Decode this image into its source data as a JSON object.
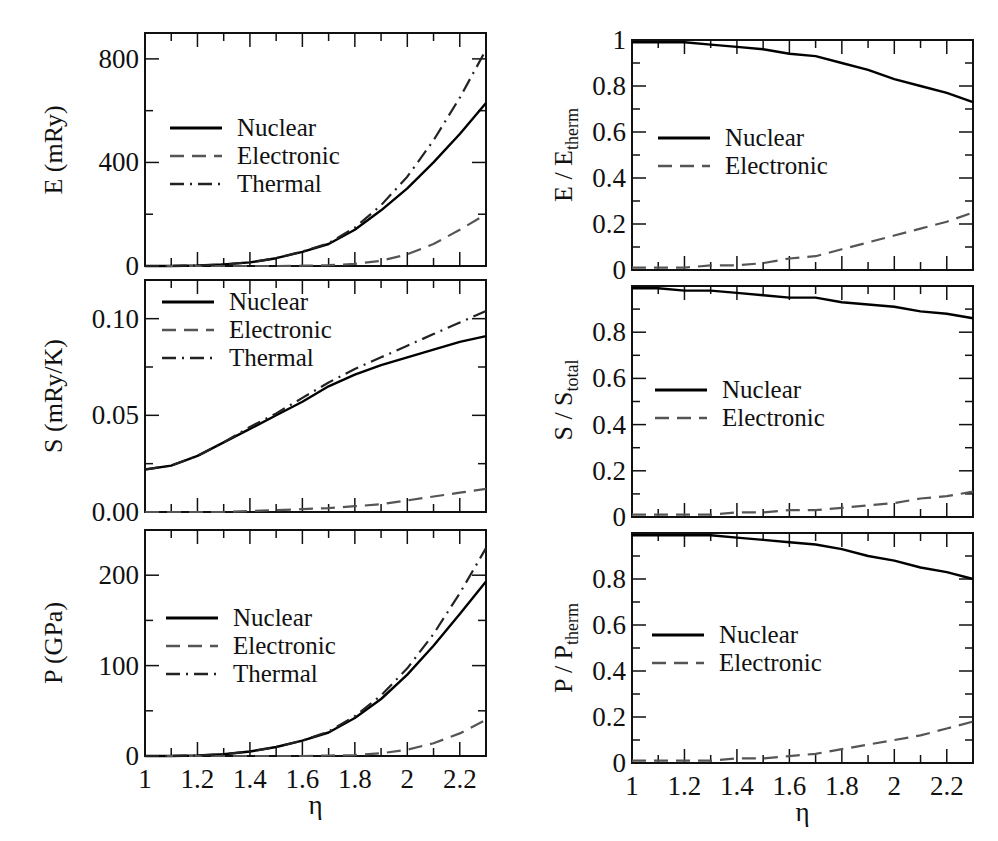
{
  "chart_data": [
    {
      "type": "line",
      "panel": "top-left",
      "title": "",
      "xlabel": "",
      "ylabel": "E  (mRy)",
      "xlim": [
        1.0,
        2.3
      ],
      "ylim": [
        0,
        900
      ],
      "yticks": [
        "0",
        "400",
        "800"
      ],
      "legend": [
        "Nuclear",
        "Electronic",
        "Thermal"
      ],
      "x": [
        1.0,
        1.1,
        1.2,
        1.3,
        1.4,
        1.5,
        1.6,
        1.7,
        1.8,
        1.9,
        2.0,
        2.1,
        2.2,
        2.3
      ],
      "series": [
        {
          "name": "Nuclear",
          "style": "solid",
          "values": [
            0,
            0,
            2,
            6,
            14,
            30,
            55,
            85,
            140,
            215,
            300,
            400,
            510,
            630
          ]
        },
        {
          "name": "Electronic",
          "style": "dashed",
          "values": [
            0,
            0,
            0,
            0,
            0,
            0,
            1,
            3,
            8,
            20,
            45,
            85,
            140,
            200
          ]
        },
        {
          "name": "Thermal",
          "style": "dash-dot",
          "values": [
            0,
            0,
            2,
            6,
            14,
            30,
            56,
            88,
            148,
            235,
            345,
            485,
            650,
            835
          ]
        }
      ]
    },
    {
      "type": "line",
      "panel": "top-right",
      "ylabel": "E / E_therm",
      "xlim": [
        1.0,
        2.3
      ],
      "ylim": [
        0,
        1
      ],
      "yticks": [
        "0",
        "0.2",
        "0.4",
        "0.6",
        "0.8",
        "1"
      ],
      "legend": [
        "Nuclear",
        "Electronic"
      ],
      "x": [
        1.0,
        1.1,
        1.2,
        1.3,
        1.4,
        1.5,
        1.6,
        1.7,
        1.8,
        1.9,
        2.0,
        2.1,
        2.2,
        2.3
      ],
      "series": [
        {
          "name": "Nuclear",
          "style": "solid",
          "values": [
            0.99,
            0.99,
            0.99,
            0.98,
            0.97,
            0.96,
            0.94,
            0.93,
            0.9,
            0.87,
            0.83,
            0.8,
            0.77,
            0.73
          ]
        },
        {
          "name": "Electronic",
          "style": "dashed",
          "values": [
            0.01,
            0.01,
            0.01,
            0.02,
            0.02,
            0.03,
            0.05,
            0.06,
            0.09,
            0.12,
            0.15,
            0.18,
            0.21,
            0.25
          ]
        }
      ]
    },
    {
      "type": "line",
      "panel": "middle-left",
      "ylabel": "S  (mRy/K)",
      "xlim": [
        1.0,
        2.3
      ],
      "ylim": [
        0,
        0.12
      ],
      "yticks": [
        "0.00",
        "0.05",
        "0.10"
      ],
      "legend": [
        "Nuclear",
        "Electronic",
        "Thermal"
      ],
      "x": [
        1.0,
        1.1,
        1.2,
        1.3,
        1.4,
        1.5,
        1.6,
        1.7,
        1.8,
        1.9,
        2.0,
        2.1,
        2.2,
        2.3
      ],
      "series": [
        {
          "name": "Nuclear",
          "style": "solid",
          "values": [
            0.022,
            0.024,
            0.029,
            0.036,
            0.043,
            0.05,
            0.057,
            0.065,
            0.071,
            0.076,
            0.08,
            0.084,
            0.088,
            0.091
          ]
        },
        {
          "name": "Electronic",
          "style": "dashed",
          "values": [
            0.0,
            0.0,
            0.0,
            0.0,
            0.0005,
            0.001,
            0.0015,
            0.002,
            0.003,
            0.004,
            0.006,
            0.008,
            0.01,
            0.012
          ]
        },
        {
          "name": "Thermal",
          "style": "dash-dot",
          "values": [
            0.022,
            0.024,
            0.029,
            0.036,
            0.044,
            0.051,
            0.059,
            0.067,
            0.074,
            0.08,
            0.086,
            0.092,
            0.098,
            0.104
          ]
        }
      ]
    },
    {
      "type": "line",
      "panel": "middle-right",
      "ylabel": "S / S_total",
      "xlim": [
        1.0,
        2.3
      ],
      "ylim": [
        0,
        1
      ],
      "yticks": [
        "0",
        "0.2",
        "0.4",
        "0.6",
        "0.8"
      ],
      "legend": [
        "Nuclear",
        "Electronic"
      ],
      "x": [
        1.0,
        1.1,
        1.2,
        1.3,
        1.4,
        1.5,
        1.6,
        1.7,
        1.8,
        1.9,
        2.0,
        2.1,
        2.2,
        2.3
      ],
      "series": [
        {
          "name": "Nuclear",
          "style": "solid",
          "values": [
            0.99,
            0.99,
            0.98,
            0.98,
            0.97,
            0.96,
            0.95,
            0.95,
            0.93,
            0.92,
            0.91,
            0.89,
            0.88,
            0.86
          ]
        },
        {
          "name": "Electronic",
          "style": "dashed",
          "values": [
            0.01,
            0.01,
            0.01,
            0.01,
            0.02,
            0.02,
            0.03,
            0.03,
            0.04,
            0.05,
            0.06,
            0.08,
            0.09,
            0.11
          ]
        }
      ]
    },
    {
      "type": "line",
      "panel": "bottom-left",
      "xlabel": "η",
      "ylabel": "P  (GPa)",
      "xlim": [
        1.0,
        2.3
      ],
      "ylim": [
        0,
        250
      ],
      "yticks": [
        "0",
        "100",
        "200"
      ],
      "xticks": [
        "1",
        "1.2",
        "1.4",
        "1.6",
        "1.8",
        "2",
        "2.2"
      ],
      "legend": [
        "Nuclear",
        "Electronic",
        "Thermal"
      ],
      "x": [
        1.0,
        1.1,
        1.2,
        1.3,
        1.4,
        1.5,
        1.6,
        1.7,
        1.8,
        1.9,
        2.0,
        2.1,
        2.2,
        2.3
      ],
      "series": [
        {
          "name": "Nuclear",
          "style": "solid",
          "values": [
            0,
            0,
            0.5,
            2,
            5,
            10,
            17,
            26,
            42,
            63,
            90,
            122,
            157,
            193
          ]
        },
        {
          "name": "Electronic",
          "style": "dashed",
          "values": [
            0,
            0,
            0,
            0,
            0,
            0,
            0,
            0.5,
            1,
            3,
            7,
            14,
            25,
            40
          ]
        },
        {
          "name": "Thermal",
          "style": "dash-dot",
          "values": [
            0,
            0,
            0.5,
            2,
            5,
            10,
            17,
            27,
            44,
            67,
            97,
            135,
            180,
            230
          ]
        }
      ]
    },
    {
      "type": "line",
      "panel": "bottom-right",
      "xlabel": "η",
      "ylabel": "P / P_therm",
      "xlim": [
        1.0,
        2.3
      ],
      "ylim": [
        0,
        1
      ],
      "yticks": [
        "0",
        "0.2",
        "0.4",
        "0.6",
        "0.8"
      ],
      "xticks": [
        "1",
        "1.2",
        "1.4",
        "1.6",
        "1.8",
        "2",
        "2.2"
      ],
      "legend": [
        "Nuclear",
        "Electronic"
      ],
      "x": [
        1.0,
        1.1,
        1.2,
        1.3,
        1.4,
        1.5,
        1.6,
        1.7,
        1.8,
        1.9,
        2.0,
        2.1,
        2.2,
        2.3
      ],
      "series": [
        {
          "name": "Nuclear",
          "style": "solid",
          "values": [
            0.99,
            0.99,
            0.99,
            0.99,
            0.98,
            0.97,
            0.96,
            0.95,
            0.93,
            0.9,
            0.88,
            0.85,
            0.83,
            0.8
          ]
        },
        {
          "name": "Electronic",
          "style": "dashed",
          "values": [
            0.01,
            0.01,
            0.01,
            0.01,
            0.02,
            0.02,
            0.03,
            0.04,
            0.06,
            0.08,
            0.1,
            0.12,
            0.15,
            0.18
          ]
        }
      ]
    }
  ],
  "labels": {
    "xlabel": "η",
    "nuclear": "Nuclear",
    "electronic": "Electronic",
    "thermal": "Thermal",
    "e_ylabel": "E  (mRy)",
    "s_ylabel": "S  (mRy/K)",
    "p_ylabel": "P  (GPa)",
    "e_ratio_main": "E / E",
    "e_ratio_sub": "therm",
    "s_ratio_main": "S / S",
    "s_ratio_sub": "total",
    "p_ratio_main": "P / P",
    "p_ratio_sub": "therm"
  }
}
